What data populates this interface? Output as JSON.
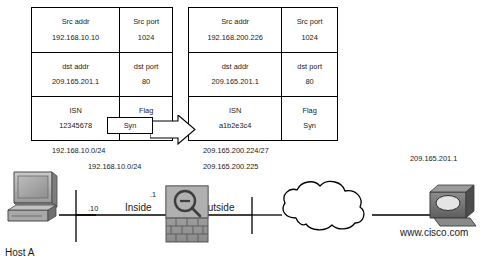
{
  "diagram": {
    "tables": [
      {
        "id": "pre-translation",
        "name": "Original packet header",
        "rows": [
          {
            "fields": [
              {
                "key": "Src addr",
                "value": "192.168.10.10"
              },
              {
                "key": "Src port",
                "value": "1024"
              }
            ]
          },
          {
            "fields": [
              {
                "key": "dst addr",
                "value": "209.165.201.1"
              },
              {
                "key": "dst port",
                "value": "80"
              }
            ]
          },
          {
            "fields": [
              {
                "key": "ISN",
                "value": "12345678"
              },
              {
                "key": "Flag",
                "value": "Syn"
              }
            ]
          }
        ]
      },
      {
        "id": "post-translation",
        "name": "Translated packet header",
        "rows": [
          {
            "fields": [
              {
                "key": "Src addr",
                "value": "192.168.200.226"
              },
              {
                "key": "Src port",
                "value": "1024"
              }
            ]
          },
          {
            "fields": [
              {
                "key": "dst addr",
                "value": "209.165.201.1"
              },
              {
                "key": "dst port",
                "value": "80"
              }
            ]
          },
          {
            "fields": [
              {
                "key": "ISN",
                "value": "a1b2e3c4"
              },
              {
                "key": "Flag",
                "value": "Syn"
              }
            ]
          }
        ]
      }
    ],
    "highlight": {
      "syn_label": "Syn"
    },
    "network_labels": {
      "inside_subnet_top": "192.168.10.0/24",
      "inside_subnet_bottom": "192.168.10.0/24",
      "outside_subnet": "209.165.200.224/27",
      "outside_address": "209.165.200.225",
      "server_address": "209.165.201.1",
      "host_host_id": ".10",
      "firewall_host_id": ".1"
    },
    "zones": {
      "inside": "Inside",
      "outside": "Outside"
    },
    "devices": {
      "host": {
        "label": "Host A",
        "icon": "desktop-computer-icon"
      },
      "firewall": {
        "label": "",
        "icon": "firewall-brick-wall-icon"
      },
      "cloud": {
        "label": "",
        "icon": "network-cloud-icon"
      },
      "server": {
        "label": "www.cisco.com",
        "icon": "server-icon"
      }
    },
    "colors": {
      "line": "#000000",
      "device_fill": "#9a9a9a",
      "device_dark": "#5e5e5e",
      "device_light": "#c9c9c9",
      "background": "#ffffff"
    }
  }
}
